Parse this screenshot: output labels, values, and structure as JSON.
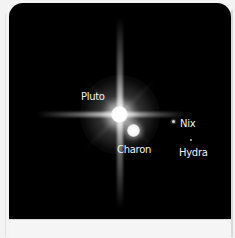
{
  "figure": {
    "background_color": "#000000",
    "page_color": "#f3f3f3",
    "labels": {
      "pluto": "Pluto",
      "charon": "Charon",
      "nix": "Nix",
      "hydra": "Hydra"
    }
  }
}
